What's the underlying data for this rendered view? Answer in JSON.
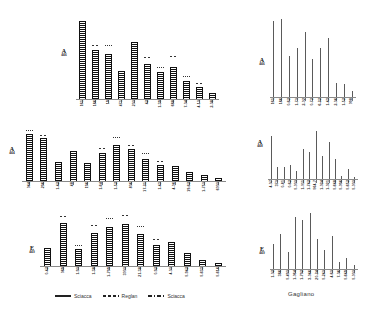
{
  "figure": {
    "caption_right": "Gagliano"
  },
  "legend": {
    "items": [
      {
        "label": "Sciacca",
        "style": "solid"
      },
      {
        "label": "Reglan",
        "style": "dashed"
      },
      {
        "label": "Sciacca",
        "style": "dashdot"
      }
    ]
  },
  "chart_data": [
    {
      "id": "top-left",
      "type": "bar",
      "title": "",
      "ylabel_big": "A",
      "ylabel_small": "446",
      "xlabel": "",
      "grid": false,
      "legend_position": "bottom",
      "ylim": [
        0,
        100
      ],
      "categories": [
        "161",
        "186",
        "19",
        "471",
        "200",
        "42",
        "1-39",
        "688",
        "7-04",
        "4-10",
        "2-08"
      ],
      "values": [
        96,
        60,
        56,
        34,
        70,
        43,
        33,
        40,
        22,
        15,
        8
      ],
      "caps": [
        0,
        6,
        9,
        0,
        0,
        8,
        5,
        12,
        5,
        4,
        0
      ]
    },
    {
      "id": "mid-left",
      "type": "bar",
      "title": "",
      "ylabel_big": "A",
      "ylabel_small": "444",
      "xlabel": "",
      "grid": false,
      "legend_position": "bottom",
      "ylim": [
        0,
        100
      ],
      "categories": [
        "044",
        "296",
        "1-42",
        "48",
        "196",
        "1-64",
        "1-52",
        "806",
        "17-21",
        "1-43",
        "4-06",
        "19-62",
        "1-750",
        "6000"
      ],
      "values": [
        93,
        85,
        38,
        58,
        36,
        55,
        70,
        62,
        44,
        32,
        30,
        18,
        11,
        6
      ],
      "caps": [
        6,
        4,
        0,
        0,
        0,
        7,
        14,
        6,
        9,
        5,
        0,
        0,
        0,
        0
      ]
    },
    {
      "id": "bot-left",
      "type": "bar",
      "title": "",
      "ylabel_big": "E",
      "ylabel_small": "449",
      "xlabel": "",
      "grid": false,
      "legend_position": "bottom",
      "ylim": [
        0,
        100
      ],
      "categories": [
        "0-42",
        "089",
        "1-90",
        "1-38",
        "1-799",
        "3000",
        "21-38",
        "0-92",
        "4-00",
        "0-942",
        "0-633",
        "0-616"
      ],
      "values": [
        36,
        85,
        34,
        64,
        76,
        82,
        62,
        42,
        48,
        25,
        12,
        6
      ],
      "caps": [
        0,
        12,
        6,
        14,
        16,
        17,
        14,
        9,
        0,
        0,
        0,
        0
      ]
    },
    {
      "id": "top-right",
      "type": "bar",
      "title": "",
      "ylabel_big": "A",
      "ylabel_small": "446",
      "xlabel": "Gagliano",
      "grid": false,
      "legend_position": "bottom",
      "ylim": [
        0,
        100
      ],
      "categories": [
        "161",
        "186",
        "0-62",
        "1-70",
        "2-02",
        "0-72",
        "6-22",
        "1-43",
        "2-06",
        "1-52",
        "098"
      ],
      "values": [
        96,
        99,
        52,
        62,
        82,
        48,
        62,
        75,
        18,
        16,
        7
      ]
    },
    {
      "id": "mid-right",
      "type": "bar",
      "title": "",
      "ylabel_big": "A",
      "ylabel_small": "448",
      "xlabel": "Gagliano",
      "grid": false,
      "legend_position": "bottom",
      "ylim": [
        0,
        100
      ],
      "categories": [
        "4-07",
        "370",
        "0-81",
        "0-62",
        "0-000",
        "1-011",
        "1-742",
        "064-7",
        "1-024",
        "1-021",
        "0-648",
        "0-096",
        "0-652",
        "0-000"
      ],
      "values": [
        78,
        22,
        22,
        26,
        14,
        54,
        50,
        88,
        42,
        68,
        36,
        6,
        18,
        4
      ]
    },
    {
      "id": "bot-right",
      "type": "bar",
      "title": "",
      "ylabel_big": "E",
      "ylabel_small": "449",
      "xlabel": "Gagliano",
      "grid": false,
      "legend_position": "bottom",
      "ylim": [
        0,
        100
      ],
      "categories": [
        "1-02",
        "386",
        "0-490",
        "1-064",
        "1-792",
        "3-046",
        "20-24",
        "0-240",
        "4-60",
        "7-06",
        "0-649",
        "0-000"
      ],
      "values": [
        44,
        62,
        30,
        92,
        86,
        98,
        52,
        34,
        58,
        12,
        20,
        7
      ]
    }
  ]
}
